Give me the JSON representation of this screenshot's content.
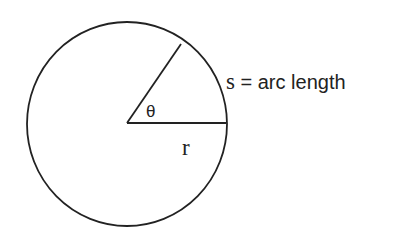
{
  "diagram": {
    "type": "geometry",
    "circle": {
      "center": [
        127,
        124
      ],
      "radius_x": 100,
      "radius_y": 102
    },
    "radius_line": {
      "from": [
        127,
        123
      ],
      "to": [
        226,
        123
      ]
    },
    "angle_line": {
      "from": [
        127,
        123
      ],
      "to": [
        181,
        44
      ]
    },
    "labels": {
      "theta": "θ",
      "radius": "r",
      "arc_symbol": "s",
      "arc_rest": " = arc length"
    },
    "colors": {
      "stroke": "#222222",
      "text": "#222222",
      "background": "#ffffff"
    }
  }
}
